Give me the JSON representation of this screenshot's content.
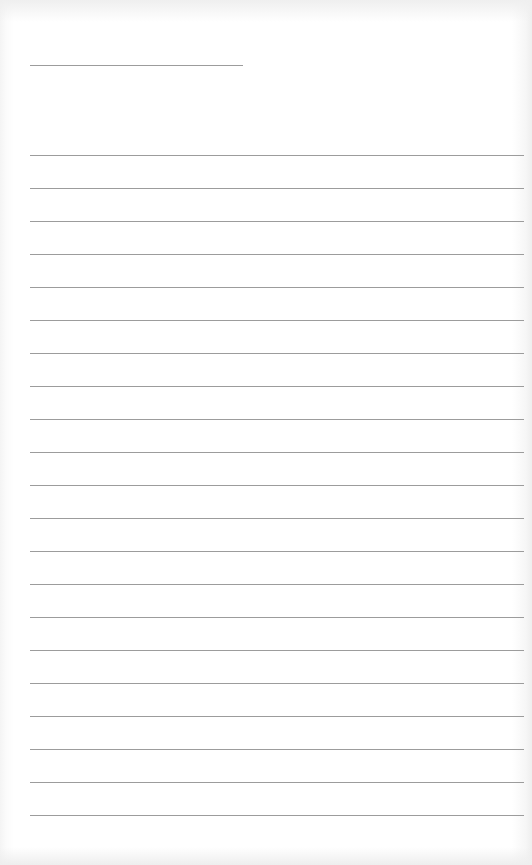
{
  "page": {
    "type": "blank lined paper",
    "title_line": {
      "x": 30,
      "y": 65,
      "width": 213
    },
    "ruled_lines": {
      "count": 21,
      "start_y": 155,
      "spacing": 33,
      "x": 30,
      "width": 494
    },
    "colors": {
      "paper": "#ffffff",
      "line": "#9c9c9c",
      "edge_shadow": "#eeeeee"
    }
  }
}
